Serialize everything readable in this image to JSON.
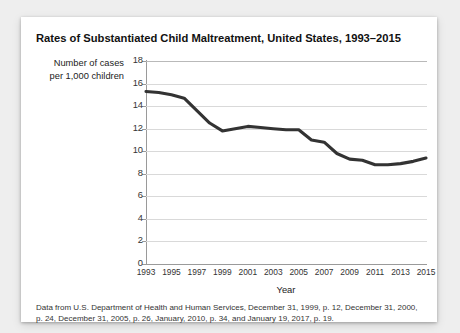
{
  "card": {
    "title": "Rates of Substantiated Child Maltreatment, United States, 1993–2015",
    "source_note": "Data from U.S. Department of Health and Human Services, December 31, 1999, p. 12, December 31, 2000, p. 24, December 31, 2005, p. 26, January, 2010, p. 34, and January 19, 2017, p. 19."
  },
  "chart_data": {
    "type": "line",
    "title": "Rates of Substantiated Child Maltreatment, United States, 1993–2015",
    "xlabel": "Year",
    "ylabel": "Number of cases per 1,000 children",
    "ylabel_line1": "Number of cases",
    "ylabel_line2": "per 1,000 children",
    "xlim": [
      1993,
      2015
    ],
    "ylim": [
      0,
      18
    ],
    "yticks": [
      0,
      2,
      4,
      6,
      8,
      10,
      12,
      14,
      16,
      18
    ],
    "xticks": [
      1993,
      1995,
      1997,
      1999,
      2001,
      2003,
      2005,
      2007,
      2009,
      2011,
      2013,
      2015
    ],
    "grid": "horizontal",
    "legend": "none",
    "line_color": "#333333",
    "line_width": 3,
    "x": [
      1993,
      1994,
      1995,
      1996,
      1997,
      1998,
      1999,
      2000,
      2001,
      2002,
      2003,
      2004,
      2005,
      2006,
      2007,
      2008,
      2009,
      2010,
      2011,
      2012,
      2013,
      2014,
      2015
    ],
    "values": [
      15.3,
      15.2,
      15.0,
      14.7,
      13.6,
      12.5,
      11.8,
      12.0,
      12.2,
      12.1,
      12.0,
      11.9,
      11.9,
      11.0,
      10.8,
      9.8,
      9.3,
      9.2,
      8.8,
      8.8,
      8.9,
      9.1,
      9.4
    ]
  }
}
